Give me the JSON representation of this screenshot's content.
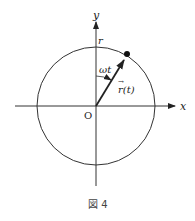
{
  "diagram": {
    "axes": {
      "x_label": "x",
      "y_label": "y",
      "origin_label": "O"
    },
    "circle": {
      "radius_label": "r"
    },
    "vector": {
      "label": "r(t)",
      "arrow_mark": "→"
    },
    "angle": {
      "label": "ωt"
    },
    "caption": "図 4"
  },
  "colors": {
    "stroke": "#222222",
    "background": "#ffffff"
  }
}
